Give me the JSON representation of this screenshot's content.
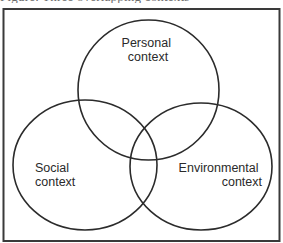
{
  "caption": {
    "text": "Figure: Three overlapping contexts",
    "visible": "partial"
  },
  "diagram": {
    "type": "venn",
    "set_count": 3,
    "stroke_color": "#2b2b2b",
    "frame_color": "#3a3a3a",
    "background": "#ffffff",
    "sets": [
      {
        "id": "personal",
        "lines": [
          "Personal",
          "context"
        ],
        "position": "top"
      },
      {
        "id": "social",
        "lines": [
          "Social",
          "context"
        ],
        "position": "bottom-left"
      },
      {
        "id": "environmental",
        "lines": [
          "Environmental",
          "context"
        ],
        "position": "bottom-right"
      }
    ]
  }
}
